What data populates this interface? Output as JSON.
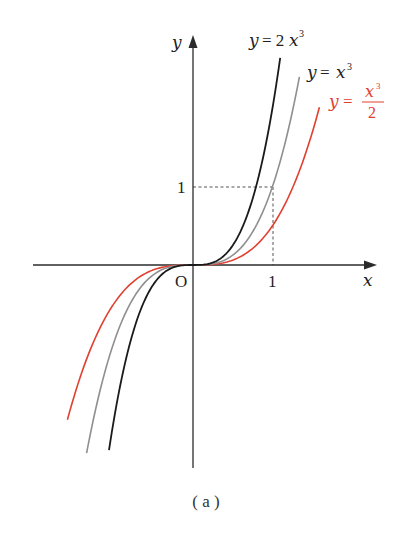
{
  "chart_data": {
    "type": "line",
    "title": "",
    "caption": "( a )",
    "xlabel": "x",
    "ylabel": "y",
    "origin_label": "O",
    "xlim": [
      -2.0,
      2.25
    ],
    "ylim": [
      -2.6,
      2.85
    ],
    "grid": false,
    "x_ticks": [
      {
        "value": 1,
        "label": "1"
      }
    ],
    "y_ticks": [
      {
        "value": 1,
        "label": "1"
      }
    ],
    "guides": [
      {
        "type": "dashed",
        "from": [
          0,
          1
        ],
        "to": [
          1,
          1
        ]
      },
      {
        "type": "dashed",
        "from": [
          1,
          0
        ],
        "to": [
          1,
          1
        ]
      }
    ],
    "series": [
      {
        "name": "y = 2x³",
        "label": "y = 2x³",
        "formula": "2*x^3",
        "color": "#1a1a1a",
        "x_range": [
          -1.05,
          1.09
        ]
      },
      {
        "name": "y = x³",
        "label": "y = x³",
        "formula": "x^3",
        "color": "#8f8f8f",
        "x_range": [
          -1.33,
          1.33
        ]
      },
      {
        "name": "y = x³/2",
        "label": "y = x³/2",
        "formula": "x^3/2",
        "color": "#e0402f",
        "x_range": [
          -1.57,
          1.58
        ]
      }
    ]
  },
  "labels": {
    "axis_x": "x",
    "axis_y": "y",
    "origin": "O",
    "tick_x1": "1",
    "tick_y1": "1",
    "curve_black_y": "y",
    "curve_black_eq": "= 2",
    "curve_black_x": "x",
    "curve_black_exp": "3",
    "curve_gray_y": "y",
    "curve_gray_eq": "=",
    "curve_gray_x": "x",
    "curve_gray_exp": "3",
    "curve_red_y": "y",
    "curve_red_eq": "=",
    "curve_red_num_x": "x",
    "curve_red_num_exp": "3",
    "curve_red_den": "2",
    "caption": "( a )"
  },
  "colors": {
    "axis": "#2b2b2b",
    "black_curve": "#1a1a1a",
    "gray_curve": "#8f8f8f",
    "red_curve": "#e0402f",
    "dashed": "#555555"
  }
}
